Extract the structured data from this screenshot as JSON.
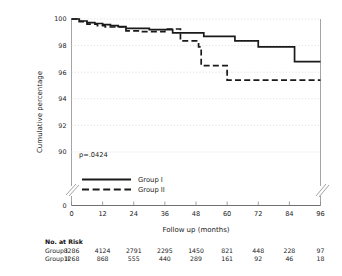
{
  "chart_data": {
    "type": "line",
    "subtype": "kaplan-meier-step",
    "title": "",
    "xlabel": "Follow up (months)",
    "ylabel": "Cumulative percentage",
    "xlim": [
      0,
      96
    ],
    "ylim": [
      89.0,
      100.2
    ],
    "xticks": [
      0,
      12,
      24,
      36,
      48,
      60,
      72,
      84,
      96
    ],
    "yticks": [
      90,
      92,
      94,
      96,
      98,
      100
    ],
    "y_axis_break": true,
    "y_axis_break_label": "0",
    "x_axis_break_right": true,
    "grid": "horizontal-dotted",
    "legend_position": "lower-left-inside",
    "annotations": [
      {
        "name": "p-value",
        "text": "p=.0424",
        "x": 6,
        "y": 91.2
      }
    ],
    "series": [
      {
        "name": "Group I",
        "style": "solid",
        "color": "#1a1a1a",
        "steps": [
          [
            0,
            100.0
          ],
          [
            3,
            99.85
          ],
          [
            6,
            99.72
          ],
          [
            9,
            99.66
          ],
          [
            12,
            99.58
          ],
          [
            15,
            99.5
          ],
          [
            18,
            99.42
          ],
          [
            21,
            99.3
          ],
          [
            27,
            99.3
          ],
          [
            30,
            99.2
          ],
          [
            36,
            99.2
          ],
          [
            39,
            98.95
          ],
          [
            48,
            98.95
          ],
          [
            51,
            98.7
          ],
          [
            60,
            98.7
          ],
          [
            63,
            98.35
          ],
          [
            69,
            98.35
          ],
          [
            72,
            97.9
          ],
          [
            84,
            97.9
          ],
          [
            86,
            96.8
          ],
          [
            96,
            96.8
          ]
        ]
      },
      {
        "name": "Group II",
        "style": "dashed",
        "color": "#1a1a1a",
        "steps": [
          [
            0,
            100.0
          ],
          [
            3,
            99.8
          ],
          [
            6,
            99.62
          ],
          [
            10,
            99.5
          ],
          [
            13,
            99.4
          ],
          [
            18,
            99.4
          ],
          [
            21,
            99.1
          ],
          [
            24,
            99.1
          ],
          [
            27,
            99.05
          ],
          [
            33,
            99.05
          ],
          [
            36,
            99.25
          ],
          [
            40,
            99.25
          ],
          [
            42,
            98.35
          ],
          [
            48,
            98.35
          ],
          [
            49,
            97.9
          ],
          [
            50,
            96.5
          ],
          [
            58,
            96.5
          ],
          [
            60,
            95.4
          ],
          [
            96,
            95.4
          ]
        ]
      }
    ]
  },
  "risk_table": {
    "title": "No. at Risk",
    "rows": [
      {
        "label": "Group I",
        "values": [
          "8286",
          "4124",
          "2791",
          "2295",
          "1450",
          "821",
          "448",
          "228",
          "97"
        ]
      },
      {
        "label": "Group II",
        "values": [
          "1268",
          "868",
          "555",
          "440",
          "289",
          "161",
          "92",
          "46",
          "18"
        ]
      }
    ]
  },
  "legend": {
    "entries": [
      {
        "label": "Group I",
        "style": "solid"
      },
      {
        "label": "Group II",
        "style": "dashed"
      }
    ]
  }
}
